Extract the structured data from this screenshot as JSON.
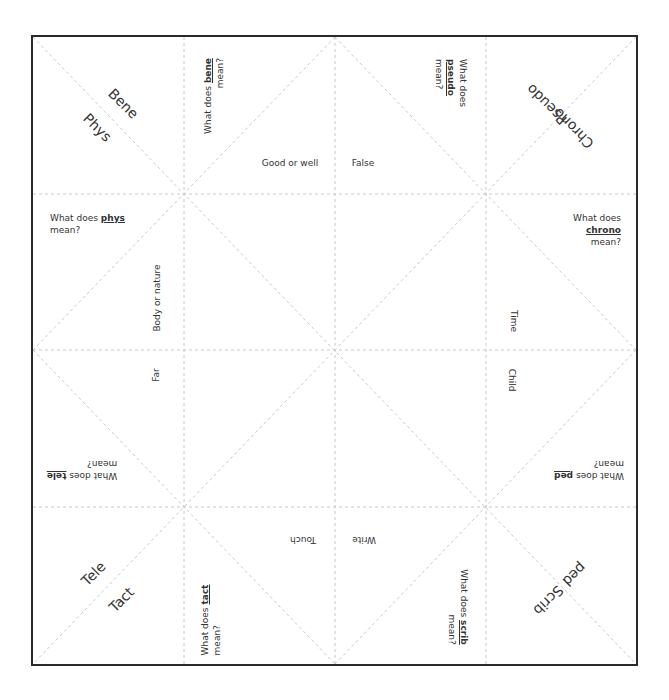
{
  "diagram": {
    "type": "fortune-teller-cootie-catcher",
    "corner_labels": {
      "top_left": [
        "Bene",
        "Phys"
      ],
      "top_right": [
        "Pseudo",
        "Chrono"
      ],
      "bottom_left": [
        "Tele",
        "Tact"
      ],
      "bottom_right": [
        "ped",
        "Scrib"
      ]
    },
    "questions": {
      "bene": {
        "pre": "What does ",
        "word": "bene",
        "post": "mean?"
      },
      "pseudo": {
        "pre": "What does",
        "word": "pseudo",
        "post": "mean?"
      },
      "phys": {
        "pre": "What does ",
        "word": "phys",
        "post": "mean?"
      },
      "chrono": {
        "pre": "What does",
        "word": "chrono",
        "post": "mean?"
      },
      "tele": {
        "pre": "What does ",
        "word": "tele",
        "post": "mean?"
      },
      "ped": {
        "pre": "What does ",
        "word": "ped",
        "post": "mean?"
      },
      "tact": {
        "pre": "What does ",
        "word": "tact",
        "post": "mean?"
      },
      "scrib": {
        "pre": "What does ",
        "word": "scrib",
        "post": "mean?"
      }
    },
    "answers": {
      "bene": "Good or well",
      "pseudo": "False",
      "phys": "Body or nature",
      "chrono": "Time",
      "tele": "Far",
      "ped": "Child",
      "tact": "Touch",
      "scrib": "Write"
    },
    "colors": {
      "border": "#2a2a2a",
      "fold_lines": "#c8c8c8",
      "text": "#333333"
    }
  }
}
